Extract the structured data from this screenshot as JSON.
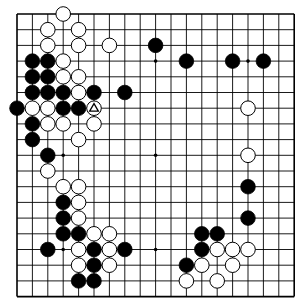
{
  "board": {
    "size": 19,
    "origin_x": 17,
    "origin_y": 14,
    "spacing_x": 15.4,
    "spacing_y": 15.7,
    "stone_radius": 7.3,
    "colors": {
      "background": "#ffffff",
      "line": "#000000",
      "black_stone": "#000000",
      "white_stone": "#ffffff",
      "white_stone_outline": "#000000"
    },
    "star_points": [
      [
        3,
        3
      ],
      [
        9,
        3
      ],
      [
        15,
        3
      ],
      [
        3,
        9
      ],
      [
        9,
        9
      ],
      [
        15,
        9
      ],
      [
        3,
        15
      ],
      [
        9,
        15
      ],
      [
        15,
        15
      ]
    ],
    "stones": [
      {
        "c": 3,
        "r": 0,
        "color": "white"
      },
      {
        "c": 2,
        "r": 1,
        "color": "white"
      },
      {
        "c": 4,
        "r": 1,
        "color": "white"
      },
      {
        "c": 2,
        "r": 2,
        "color": "white"
      },
      {
        "c": 4,
        "r": 2,
        "color": "white"
      },
      {
        "c": 6,
        "r": 2,
        "color": "white"
      },
      {
        "c": 9,
        "r": 2,
        "color": "black"
      },
      {
        "c": 1,
        "r": 3,
        "color": "black"
      },
      {
        "c": 2,
        "r": 3,
        "color": "black"
      },
      {
        "c": 3,
        "r": 3,
        "color": "white"
      },
      {
        "c": 11,
        "r": 3,
        "color": "black"
      },
      {
        "c": 14,
        "r": 3,
        "color": "black"
      },
      {
        "c": 16,
        "r": 3,
        "color": "black"
      },
      {
        "c": 1,
        "r": 4,
        "color": "black"
      },
      {
        "c": 2,
        "r": 4,
        "color": "black"
      },
      {
        "c": 3,
        "r": 4,
        "color": "white"
      },
      {
        "c": 4,
        "r": 4,
        "color": "white"
      },
      {
        "c": 1,
        "r": 5,
        "color": "black"
      },
      {
        "c": 2,
        "r": 5,
        "color": "black"
      },
      {
        "c": 3,
        "r": 5,
        "color": "black"
      },
      {
        "c": 4,
        "r": 5,
        "color": "white"
      },
      {
        "c": 5,
        "r": 5,
        "color": "black"
      },
      {
        "c": 7,
        "r": 5,
        "color": "black"
      },
      {
        "c": 0,
        "r": 6,
        "color": "black"
      },
      {
        "c": 1,
        "r": 6,
        "color": "white"
      },
      {
        "c": 2,
        "r": 6,
        "color": "white"
      },
      {
        "c": 3,
        "r": 6,
        "color": "black"
      },
      {
        "c": 4,
        "r": 6,
        "color": "black"
      },
      {
        "c": 5,
        "r": 6,
        "color": "white",
        "marker": "triangle"
      },
      {
        "c": 15,
        "r": 6,
        "color": "white"
      },
      {
        "c": 1,
        "r": 7,
        "color": "black"
      },
      {
        "c": 2,
        "r": 7,
        "color": "white"
      },
      {
        "c": 3,
        "r": 7,
        "color": "white"
      },
      {
        "c": 5,
        "r": 7,
        "color": "white"
      },
      {
        "c": 1,
        "r": 8,
        "color": "black"
      },
      {
        "c": 4,
        "r": 8,
        "color": "white"
      },
      {
        "c": 2,
        "r": 9,
        "color": "black"
      },
      {
        "c": 15,
        "r": 9,
        "color": "white"
      },
      {
        "c": 2,
        "r": 10,
        "color": "white"
      },
      {
        "c": 3,
        "r": 11,
        "color": "white"
      },
      {
        "c": 4,
        "r": 11,
        "color": "white"
      },
      {
        "c": 15,
        "r": 11,
        "color": "black"
      },
      {
        "c": 3,
        "r": 12,
        "color": "black"
      },
      {
        "c": 4,
        "r": 12,
        "color": "white"
      },
      {
        "c": 3,
        "r": 13,
        "color": "black"
      },
      {
        "c": 4,
        "r": 13,
        "color": "white"
      },
      {
        "c": 15,
        "r": 13,
        "color": "black"
      },
      {
        "c": 3,
        "r": 14,
        "color": "black"
      },
      {
        "c": 4,
        "r": 14,
        "color": "black"
      },
      {
        "c": 5,
        "r": 14,
        "color": "white"
      },
      {
        "c": 6,
        "r": 14,
        "color": "white"
      },
      {
        "c": 12,
        "r": 14,
        "color": "black"
      },
      {
        "c": 13,
        "r": 14,
        "color": "black"
      },
      {
        "c": 2,
        "r": 15,
        "color": "black"
      },
      {
        "c": 4,
        "r": 15,
        "color": "white"
      },
      {
        "c": 5,
        "r": 15,
        "color": "black"
      },
      {
        "c": 6,
        "r": 15,
        "color": "white"
      },
      {
        "c": 7,
        "r": 15,
        "color": "black"
      },
      {
        "c": 12,
        "r": 15,
        "color": "black"
      },
      {
        "c": 13,
        "r": 15,
        "color": "white"
      },
      {
        "c": 14,
        "r": 15,
        "color": "white"
      },
      {
        "c": 15,
        "r": 15,
        "color": "white"
      },
      {
        "c": 4,
        "r": 16,
        "color": "white"
      },
      {
        "c": 5,
        "r": 16,
        "color": "black"
      },
      {
        "c": 6,
        "r": 16,
        "color": "white"
      },
      {
        "c": 11,
        "r": 16,
        "color": "black"
      },
      {
        "c": 12,
        "r": 16,
        "color": "white"
      },
      {
        "c": 14,
        "r": 16,
        "color": "white"
      },
      {
        "c": 4,
        "r": 17,
        "color": "black"
      },
      {
        "c": 5,
        "r": 17,
        "color": "black"
      },
      {
        "c": 11,
        "r": 17,
        "color": "white"
      },
      {
        "c": 13,
        "r": 17,
        "color": "white"
      }
    ]
  }
}
